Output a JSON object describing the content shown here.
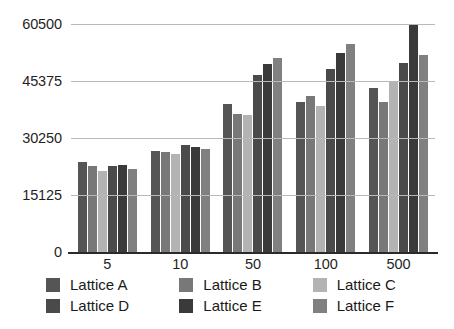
{
  "chart_data": {
    "type": "bar",
    "title": "",
    "subtitle": "",
    "xlabel": "",
    "ylabel": "",
    "categories": [
      "5",
      "10",
      "50",
      "100",
      "500"
    ],
    "ylim": [
      0,
      60500
    ],
    "yticks": [
      0,
      15125,
      30250,
      45375,
      60500
    ],
    "ytick_labels": [
      "0",
      "15125",
      "30250",
      "45375",
      "60500"
    ],
    "grid": true,
    "legend_position": "bottom",
    "orientation": "vertical",
    "series": [
      {
        "name": "Lattice A",
        "color": "#555555",
        "values": [
          23900,
          26800,
          39200,
          39800,
          43500
        ]
      },
      {
        "name": "Lattice B",
        "color": "#787878",
        "values": [
          22800,
          26500,
          36600,
          41500,
          39800
        ]
      },
      {
        "name": "Lattice C",
        "color": "#b3b3b3",
        "values": [
          21500,
          25900,
          36300,
          38700,
          45100
        ]
      },
      {
        "name": "Lattice D",
        "color": "#4a4a4a",
        "values": [
          22800,
          28300,
          47100,
          48600,
          50200
        ]
      },
      {
        "name": "Lattice E",
        "color": "#3a3a3a",
        "values": [
          23100,
          27900,
          49800,
          52900,
          60500
        ]
      },
      {
        "name": "Lattice F",
        "color": "#808080",
        "values": [
          22000,
          27400,
          51500,
          55100,
          52300
        ]
      }
    ]
  },
  "legend": {
    "items": [
      {
        "label": "Lattice A",
        "color": "#555555"
      },
      {
        "label": "Lattice B",
        "color": "#787878"
      },
      {
        "label": "Lattice C",
        "color": "#b3b3b3"
      },
      {
        "label": "Lattice D",
        "color": "#4a4a4a"
      },
      {
        "label": "Lattice E",
        "color": "#3a3a3a"
      },
      {
        "label": "Lattice F",
        "color": "#808080"
      }
    ]
  },
  "style": {
    "background": "#ffffff",
    "gridline_color": "#b9b9b9",
    "axis_color": "#2a2a2a",
    "text_color": "#1f1f1f"
  }
}
